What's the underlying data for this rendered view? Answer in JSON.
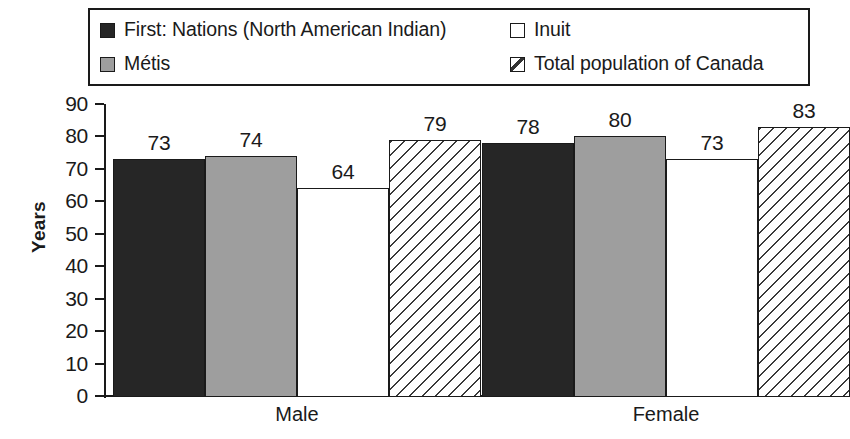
{
  "legend": {
    "items": [
      {
        "label": "First: Nations (North American Indian)",
        "swatch": "dark-square-icon",
        "column": "left",
        "row": 0
      },
      {
        "label": "Métis",
        "swatch": "gray-square-icon",
        "column": "left",
        "row": 1
      },
      {
        "label": "Inuit",
        "swatch": "white-square-icon",
        "column": "right",
        "row": 0
      },
      {
        "label": "Total population of Canada",
        "swatch": "hatched-square-icon",
        "column": "right",
        "row": 1
      }
    ]
  },
  "chart_data": {
    "type": "bar",
    "title": "",
    "xlabel": "",
    "ylabel": "Years",
    "ylim": [
      0,
      90
    ],
    "yticks": [
      0,
      10,
      20,
      30,
      40,
      50,
      60,
      70,
      80,
      90
    ],
    "grid": false,
    "legend_position": "top",
    "categories": [
      "Male",
      "Female"
    ],
    "series": [
      {
        "name": "First: Nations (North American Indian)",
        "style": "dark",
        "color": "#262626",
        "values": [
          73,
          78
        ]
      },
      {
        "name": "Métis",
        "style": "gray",
        "color": "#9e9e9e",
        "values": [
          74,
          80
        ]
      },
      {
        "name": "Inuit",
        "style": "white",
        "color": "#ffffff",
        "values": [
          64,
          73
        ]
      },
      {
        "name": "Total population of Canada",
        "style": "hatch",
        "color": "#ffffff",
        "values": [
          79,
          83
        ]
      }
    ]
  },
  "axis": {
    "tick_labels": [
      "90",
      "80",
      "70",
      "60",
      "50",
      "40",
      "30",
      "20",
      "10",
      "0"
    ],
    "y_title": "Years"
  },
  "bars": [
    {
      "value": "73",
      "group": "Male",
      "series": "First: Nations (North American Indian)",
      "style": "dark"
    },
    {
      "value": "74",
      "group": "Male",
      "series": "Métis",
      "style": "gray"
    },
    {
      "value": "64",
      "group": "Male",
      "series": "Inuit",
      "style": "white"
    },
    {
      "value": "79",
      "group": "Male",
      "series": "Total population of Canada",
      "style": "hatch"
    },
    {
      "value": "78",
      "group": "Female",
      "series": "First: Nations (North American Indian)",
      "style": "dark"
    },
    {
      "value": "80",
      "group": "Female",
      "series": "Métis",
      "style": "gray"
    },
    {
      "value": "73",
      "group": "Female",
      "series": "Inuit",
      "style": "white"
    },
    {
      "value": "83",
      "group": "Female",
      "series": "Total population of Canada",
      "style": "hatch"
    }
  ],
  "group_labels": [
    "Male",
    "Female"
  ],
  "colors": {
    "dark": "#262626",
    "gray": "#9e9e9e",
    "white": "#ffffff",
    "outline": "#1a1a1a"
  }
}
